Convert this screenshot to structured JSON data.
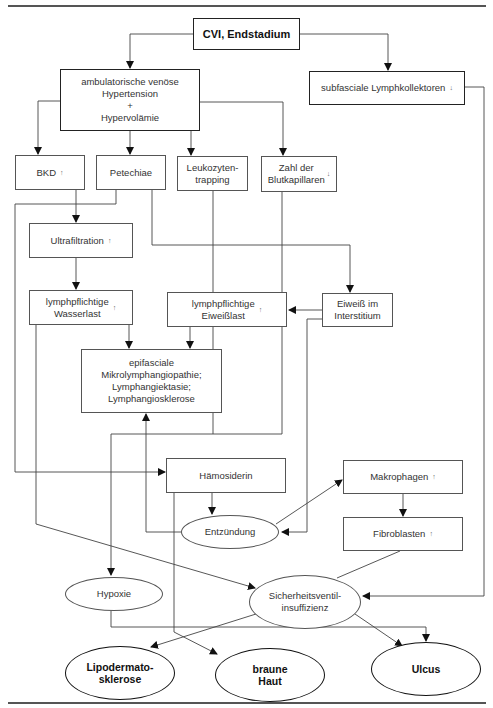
{
  "diagram": {
    "title_node": {
      "label": "CVI, Endstadium"
    },
    "nodes": {
      "ambulatorisch": {
        "label": "ambulatorische venöse\nHypertension\n+\nHypervolämie"
      },
      "subfascial": {
        "label": "subfasciale Lymphkollektoren",
        "indicator": "↓"
      },
      "bkd": {
        "label": "BKD",
        "indicator": "↑"
      },
      "petechiae": {
        "label": "Petechiae"
      },
      "leukozyten": {
        "label": "Leukozyten-\ntrapping"
      },
      "zahl": {
        "label": "Zahl der\nBlutkapillaren",
        "indicator": "↓"
      },
      "ultrafiltration": {
        "label": "Ultrafiltration",
        "indicator": "↑"
      },
      "wasserlast": {
        "label": "lymphpflichtige\nWasserlast",
        "indicator": "↑"
      },
      "eiweisslast": {
        "label": "lymphpflichtige\nEiweißlast",
        "indicator": "↑"
      },
      "eiweiss_interstitium": {
        "label": "Eiweiß im\nInterstitium"
      },
      "epifasciale": {
        "label": "epifasciale\nMikrolymphangiopathie;\nLymphangiektasie;\nLymphangiosklerose"
      },
      "haemosiderin": {
        "label": "Hämosiderin"
      },
      "makrophagen": {
        "label": "Makrophagen",
        "indicator": "↑"
      },
      "fibroblasten": {
        "label": "Fibroblasten",
        "indicator": "↑"
      },
      "entzuendung": {
        "label": "Entzündung"
      },
      "hypoxie": {
        "label": "Hypoxie"
      },
      "sicherheitsventil": {
        "label": "Sicherheitsventil-\ninsuffizienz"
      }
    },
    "outcomes": {
      "lipodermatosklerose": {
        "label": "Lipodermato-\nsklerose"
      },
      "braune_haut": {
        "label": "braune\nHaut"
      },
      "ulcus": {
        "label": "Ulcus"
      }
    },
    "colors": {
      "line": "#444444",
      "border": "#555555",
      "text": "#333333"
    }
  }
}
